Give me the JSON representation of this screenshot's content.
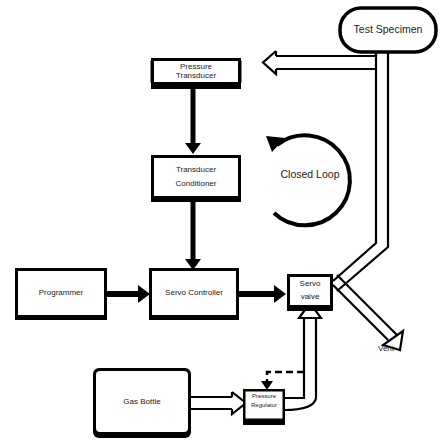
{
  "diagram": {
    "nodes": {
      "test_specimen": "Test Specimen",
      "pressure_transducer_1": "Pressure",
      "pressure_transducer_2": "Transducer",
      "transducer_conditioner_1": "Transducer",
      "transducer_conditioner_2": "Conditioner",
      "programmer": "Programmer",
      "servo_controller": "Servo Controller",
      "servo_valve_1": "Servo",
      "servo_valve_2": "valve",
      "gas_bottle": "Gas Bottle",
      "pressure_regulator_1": "Pressure",
      "pressure_regulator_2": "Regulator"
    },
    "annotations": {
      "closed_loop": "Closed Loop",
      "vent": "Vent"
    },
    "edges": [
      {
        "from": "Pressure Transducer",
        "to": "Transducer Conditioner",
        "type": "signal"
      },
      {
        "from": "Transducer Conditioner",
        "to": "Servo Controller",
        "type": "signal"
      },
      {
        "from": "Programmer",
        "to": "Servo Controller",
        "type": "signal"
      },
      {
        "from": "Servo Controller",
        "to": "Servo valve",
        "type": "signal"
      },
      {
        "from": "Servo valve",
        "to": "Test Specimen",
        "type": "gas"
      },
      {
        "from": "Test Specimen",
        "to": "Pressure Transducer",
        "type": "gas"
      },
      {
        "from": "Servo valve",
        "to": "Vent",
        "type": "gas"
      },
      {
        "from": "Gas Bottle",
        "to": "Pressure Regulator",
        "type": "gas"
      },
      {
        "from": "Pressure Regulator",
        "to": "Servo valve",
        "type": "gas"
      },
      {
        "from": "Servo valve supply line",
        "to": "Pressure Regulator",
        "type": "pilot-dashed"
      }
    ],
    "colors": {
      "line": "#000000",
      "background": "#ffffff"
    }
  }
}
